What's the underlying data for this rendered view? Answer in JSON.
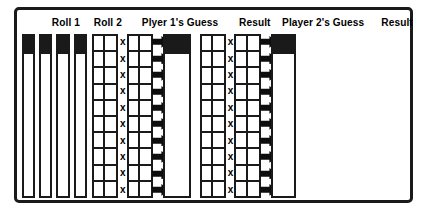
{
  "worksheet": {
    "title": "Dice game score worksheet",
    "row_count": 10,
    "frame_color": "#1a1a1a",
    "background_color": "#ffffff",
    "sections": [
      {
        "id": "roll-1",
        "header": "Roll 1",
        "kind": "pair-of-single-columns",
        "columns": 2,
        "rows": 10
      },
      {
        "id": "roll-2",
        "header": "Roll 2",
        "kind": "pair-of-single-columns",
        "columns": 2,
        "rows": 10
      },
      {
        "id": "player-1-guess",
        "header": "Plyer 1's Guess",
        "kind": "multiply-pair",
        "operator": "x",
        "left_columns": 2,
        "right_columns": 2,
        "rows": 10,
        "arrow": "right-arrow-icon"
      },
      {
        "id": "result-1",
        "header": "Result",
        "kind": "single-column",
        "columns": 1,
        "rows": 10
      },
      {
        "id": "player-2-guess",
        "header": "Player 2's Guess",
        "kind": "multiply-pair",
        "operator": "x",
        "left_columns": 2,
        "right_columns": 2,
        "rows": 10,
        "arrow": "right-arrow-icon"
      },
      {
        "id": "result-2",
        "header": "Result",
        "kind": "single-column",
        "columns": 1,
        "rows": 10
      }
    ],
    "headers": {
      "roll_1": "Roll 1",
      "roll_2": "Roll 2",
      "player_1_guess": "Plyer 1's Guess",
      "result_1": "Result",
      "player_2_guess": "Player 2's Guess",
      "result_2": "Result"
    },
    "operator_symbol": "x"
  }
}
